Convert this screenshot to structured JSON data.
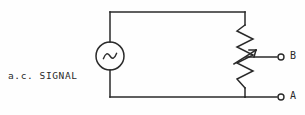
{
  "diagram": {
    "background_color": "#fefefe",
    "line_color": "#2a2a2a",
    "source_label": {
      "line1": "a.c. SIGNAL",
      "line2": "SOURCE"
    },
    "terminals": [
      {
        "id": "terminal-b",
        "label": "B",
        "x": 281,
        "y": 57
      },
      {
        "id": "terminal-a",
        "label": "A",
        "x": 281,
        "y": 97
      }
    ],
    "components": [
      {
        "id": "ac-source",
        "type": "ac-voltage-source",
        "symbol": "~",
        "cx": 110,
        "cy": 56,
        "r": 14
      },
      {
        "id": "potentiometer",
        "type": "resistor-with-wiper",
        "x": 245,
        "y_top": 25,
        "y_bottom": 88,
        "zigzag_peaks": 8
      }
    ],
    "wires": [
      {
        "id": "wire-top",
        "from_x": 110,
        "from_y": 12,
        "to_x": 245,
        "to_y": 12
      },
      {
        "id": "wire-left-top",
        "from_x": 110,
        "from_y": 12,
        "to_x": 110,
        "to_y": 42
      },
      {
        "id": "wire-left-bottom",
        "from_x": 110,
        "from_y": 70,
        "to_x": 110,
        "to_y": 97
      },
      {
        "id": "wire-bottom",
        "from_x": 110,
        "from_y": 97,
        "to_x": 245,
        "to_y": 97
      },
      {
        "id": "wire-right-top",
        "from_x": 245,
        "from_y": 12,
        "to_x": 245,
        "to_y": 25
      },
      {
        "id": "wire-right-bottom",
        "from_x": 245,
        "from_y": 88,
        "to_x": 245,
        "to_y": 97
      },
      {
        "id": "wire-wiper-lead",
        "from_x": 248,
        "from_y": 57,
        "to_x": 278,
        "to_y": 57
      },
      {
        "id": "wire-terminal-a-lead",
        "from_x": 245,
        "from_y": 97,
        "to_x": 278,
        "to_y": 97
      }
    ]
  }
}
